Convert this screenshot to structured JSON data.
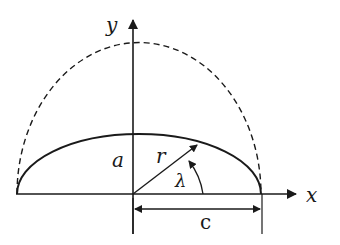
{
  "diagram": {
    "type": "ellipse-geometry",
    "labels": {
      "y_axis": "y",
      "x_axis": "x",
      "semi_minor": "a",
      "radius": "r",
      "angle": "λ",
      "semi_major": "c"
    },
    "colors": {
      "stroke": "#1a1a1a",
      "background": "#ffffff"
    },
    "geometry": {
      "origin": [
        133,
        194
      ],
      "ellipse_rx": 128,
      "ellipse_ry": 60,
      "dashed_rx": 116,
      "dashed_ry": 144,
      "radius_angle_deg": 37
    }
  }
}
